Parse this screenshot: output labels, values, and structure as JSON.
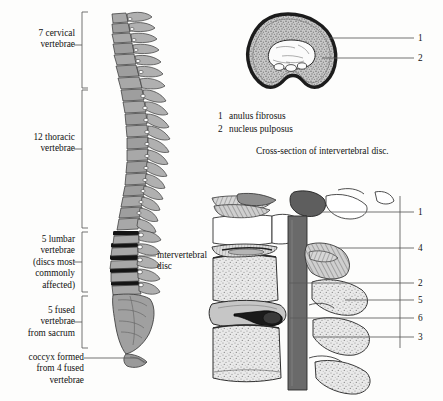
{
  "figure": {
    "background_color": "#fdfdfc",
    "ink_color": "#111111",
    "bone_gray": "#9a9a9a",
    "dark_gray": "#555555",
    "disc_black": "#141414"
  },
  "spine_labels": {
    "cervical": "7 cervical\nvertebrae",
    "thoracic": "12 thoracic\nvertebrae",
    "lumbar": "5 lumbar\nvertebrae\n(discs most\ncommonly\naffected)",
    "sacrum": "5 fused\nvertebrae\nfrom sacrum",
    "coccyx": "coccyx formed\nfrom 4 fused\nvertebrae",
    "disc": "intervertebral\ndisc"
  },
  "cross_section": {
    "caption": "Cross-section of intervertebral disc.",
    "callouts": [
      {
        "number": "1"
      },
      {
        "number": "2"
      }
    ],
    "legend": [
      {
        "number": "1",
        "term": "anulus fibrosus"
      },
      {
        "number": "2",
        "term": "nucleus pulposus"
      }
    ]
  },
  "sagittal_section": {
    "callouts": [
      {
        "number": "1"
      },
      {
        "number": "4"
      },
      {
        "number": "2"
      },
      {
        "number": "5"
      },
      {
        "number": "6"
      },
      {
        "number": "3"
      }
    ]
  }
}
